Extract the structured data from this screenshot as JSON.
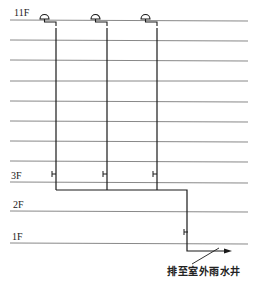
{
  "diagram": {
    "type": "rainwater-drainage-riser-diagram",
    "floors": [
      {
        "label": "11F",
        "y": 20,
        "show_label": true
      },
      {
        "label": "",
        "y": 40,
        "show_label": false
      },
      {
        "label": "",
        "y": 60,
        "show_label": false
      },
      {
        "label": "",
        "y": 81,
        "show_label": false
      },
      {
        "label": "",
        "y": 101,
        "show_label": false
      },
      {
        "label": "",
        "y": 121,
        "show_label": false
      },
      {
        "label": "",
        "y": 141,
        "show_label": false
      },
      {
        "label": "",
        "y": 161,
        "show_label": false
      },
      {
        "label": "3F",
        "y": 182,
        "show_label": true
      },
      {
        "label": "2F",
        "y": 211,
        "show_label": true
      },
      {
        "label": "1F",
        "y": 243,
        "show_label": true
      }
    ],
    "labels": {
      "floor_11": "11F",
      "floor_3": "3F",
      "floor_2": "2F",
      "floor_1": "1F",
      "outlet": "排至室外雨水井"
    },
    "risers": [
      {
        "name": "riser-1",
        "x": 56
      },
      {
        "name": "riser-2",
        "x": 107
      },
      {
        "name": "riser-3",
        "x": 157
      }
    ],
    "colors": {
      "floor_line": "#7a7a7a",
      "pipe": "#1a1a1a",
      "text": "#222222"
    }
  }
}
